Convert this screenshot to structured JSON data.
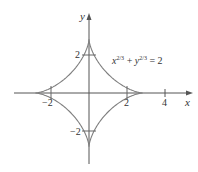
{
  "figure": {
    "equation": {
      "base_x": "x",
      "base_y": "y",
      "exponent": "2/3",
      "plus": " + ",
      "rhs": " = 2"
    },
    "axes": {
      "x_label": "x",
      "y_label": "y",
      "x_ticks": [
        "−2",
        "2",
        "4"
      ],
      "y_ticks": [
        "2",
        "−2"
      ]
    },
    "colors": {
      "curve": "#7f7f7f",
      "axis": "#555555",
      "text": "#333333"
    }
  }
}
